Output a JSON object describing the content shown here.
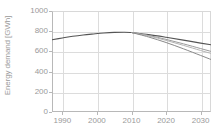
{
  "chart_data": {
    "type": "line",
    "title": "",
    "xlabel": "",
    "ylabel": "Energy demand [GWh]",
    "xlim": [
      1987,
      2033
    ],
    "ylim": [
      0,
      1000
    ],
    "grid": true,
    "legend": "none",
    "xticks": [
      1990,
      2000,
      2010,
      2020,
      2030
    ],
    "xtick_labels": [
      "1990",
      "2000",
      "2010",
      "2020",
      "2030"
    ],
    "yticks": [
      0,
      200,
      400,
      600,
      800,
      1000
    ],
    "ytick_labels": [
      "0",
      "200",
      "400",
      "600",
      "800",
      "1000"
    ],
    "series": [
      {
        "name": "historical",
        "color": "#555555",
        "width": 1.1,
        "x": [
          1987,
          1990,
          1993,
          1996,
          1999,
          2002,
          2005,
          2008,
          2010
        ],
        "values": [
          715,
          733,
          750,
          763,
          773,
          782,
          788,
          790,
          787
        ]
      },
      {
        "name": "scenario-high",
        "color": "#555555",
        "width": 1.1,
        "x": [
          2010,
          2015,
          2020,
          2025,
          2030,
          2033
        ],
        "values": [
          787,
          766,
          740,
          712,
          682,
          665
        ]
      },
      {
        "name": "scenario-mid-upper",
        "color": "#9b9b9b",
        "width": 1.0,
        "x": [
          2010,
          2015,
          2020,
          2025,
          2030,
          2033
        ],
        "values": [
          787,
          757,
          719,
          675,
          628,
          600
        ]
      },
      {
        "name": "scenario-mid-lower",
        "color": "#b5b5b5",
        "width": 1.0,
        "x": [
          2010,
          2015,
          2020,
          2025,
          2030,
          2033
        ],
        "values": [
          787,
          752,
          709,
          660,
          609,
          580
        ]
      },
      {
        "name": "scenario-low",
        "color": "#8a8a8a",
        "width": 1.0,
        "x": [
          2010,
          2015,
          2020,
          2025,
          2030,
          2033
        ],
        "values": [
          787,
          742,
          688,
          626,
          560,
          520
        ]
      }
    ]
  },
  "axes": {
    "y_axis_title": "Energy demand [GWh]"
  }
}
